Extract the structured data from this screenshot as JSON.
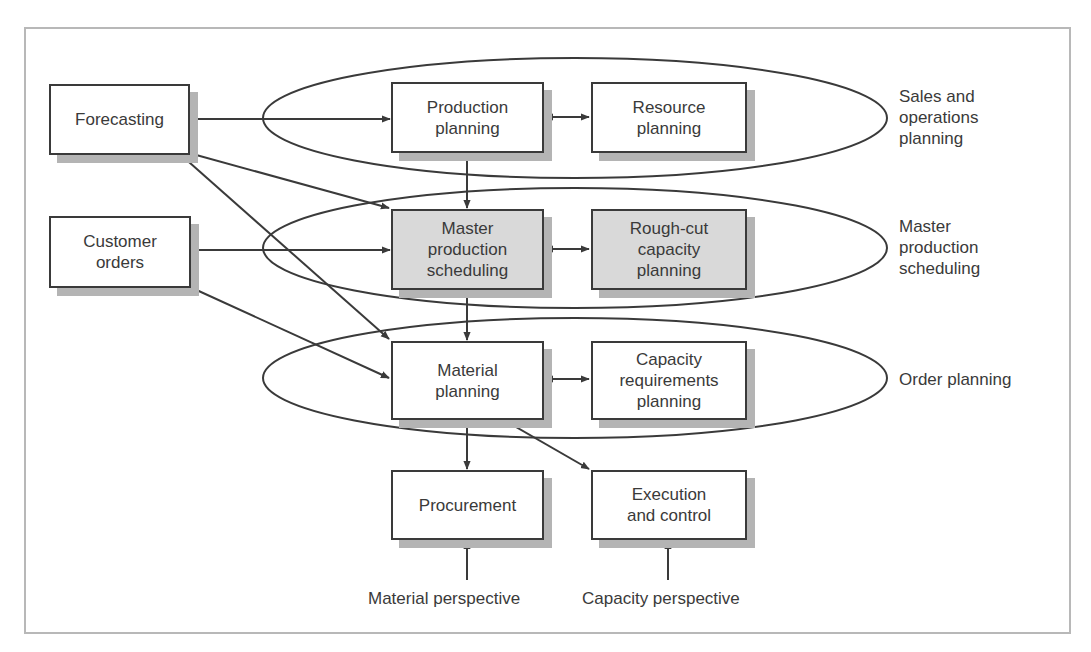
{
  "diagram": {
    "type": "flowchart",
    "colors": {
      "stroke": "#3a3a3a",
      "shadow": "#b4b4b4",
      "shaded_fill": "#d9d9d9",
      "frame": "#b8b8b8"
    },
    "inputs": {
      "forecasting": "Forecasting",
      "customer_orders": "Customer\norders"
    },
    "levels": [
      {
        "name": "Sales and\noperations\nplanning",
        "material_box": "Production\nplanning",
        "capacity_box": "Resource\nplanning",
        "shaded": false
      },
      {
        "name": "Master\nproduction\nscheduling",
        "material_box": "Master\nproduction\nscheduling",
        "capacity_box": "Rough-cut\ncapacity\nplanning",
        "shaded": true
      },
      {
        "name": "Order planning",
        "material_box": "Material\nplanning",
        "capacity_box": "Capacity\nrequirements\nplanning",
        "shaded": false
      }
    ],
    "execution": {
      "procurement": "Procurement",
      "execution_control": "Execution\nand control"
    },
    "perspectives": {
      "material": "Material perspective",
      "capacity": "Capacity perspective"
    },
    "edges": [
      {
        "from": "Forecasting",
        "to": "Production planning"
      },
      {
        "from": "Forecasting",
        "to": "Master production scheduling"
      },
      {
        "from": "Forecasting",
        "to": "Material planning"
      },
      {
        "from": "Customer orders",
        "to": "Master production scheduling"
      },
      {
        "from": "Customer orders",
        "to": "Material planning"
      },
      {
        "from": "Production planning",
        "to": "Resource planning",
        "bidirectional": true
      },
      {
        "from": "Production planning",
        "to": "Master production scheduling"
      },
      {
        "from": "Master production scheduling",
        "to": "Rough-cut capacity planning",
        "bidirectional": true
      },
      {
        "from": "Master production scheduling",
        "to": "Material planning"
      },
      {
        "from": "Material planning",
        "to": "Capacity requirements planning",
        "bidirectional": true
      },
      {
        "from": "Material planning",
        "to": "Procurement"
      },
      {
        "from": "Material planning",
        "to": "Execution and control"
      },
      {
        "from": "Material perspective",
        "to": "Procurement"
      },
      {
        "from": "Capacity perspective",
        "to": "Execution and control"
      }
    ]
  }
}
